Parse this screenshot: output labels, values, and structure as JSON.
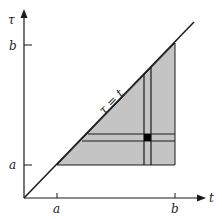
{
  "diagram": {
    "type": "region-of-integration",
    "axes": {
      "horizontal": {
        "label": "t"
      },
      "vertical": {
        "label": "τ"
      }
    },
    "ticks": {
      "t_axis": [
        "a",
        "b"
      ],
      "tau_axis": [
        "a",
        "b"
      ]
    },
    "diagonal_label": "τ = t",
    "colors": {
      "shade": "#c4c4c4",
      "ink": "#1a1a1a",
      "cell": "#000000"
    }
  }
}
